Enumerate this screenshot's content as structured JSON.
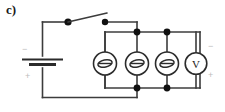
{
  "figure": {
    "panel_label": "c)",
    "width": 225,
    "height": 112,
    "background_color": "#ffffff",
    "wire_color": "#3c3c3c",
    "node_color": "#111111",
    "faint_mark_color": "#bcbcbc"
  },
  "source": {
    "name": "battery",
    "type": "dc-voltage-source",
    "negative_label": "−",
    "positive_label": "+"
  },
  "switch": {
    "name": "knife-switch",
    "state": "open"
  },
  "meters": [
    {
      "id": "meter-1",
      "type": "galvanometer",
      "label": ""
    },
    {
      "id": "meter-2",
      "type": "galvanometer",
      "label": ""
    },
    {
      "id": "meter-3",
      "type": "galvanometer",
      "label": ""
    },
    {
      "id": "meter-4",
      "type": "voltmeter",
      "label": "V"
    }
  ],
  "voltmeter_polarity": {
    "negative_label": "−",
    "positive_label": "+"
  },
  "junctions": {
    "top_rail_y": 32,
    "bottom_rail_y": 88,
    "dot_x_positions": [
      137,
      167
    ]
  }
}
